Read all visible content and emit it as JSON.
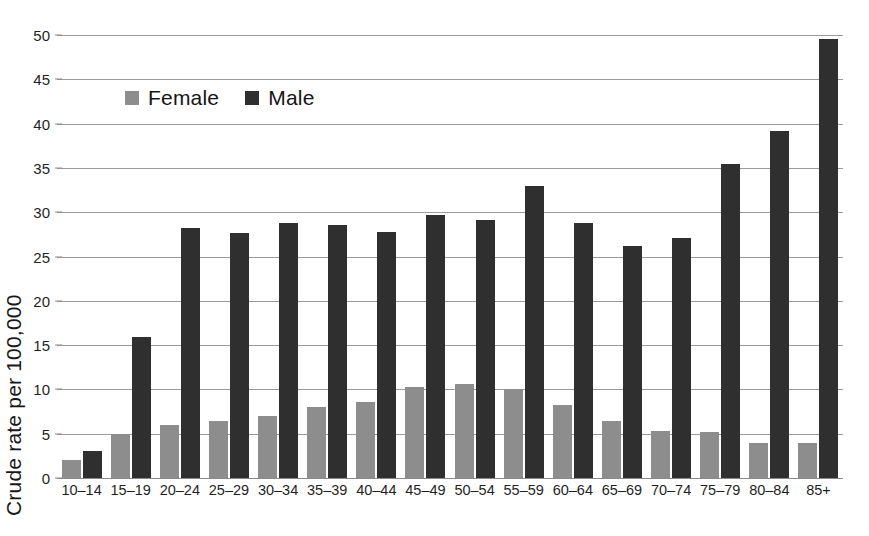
{
  "chart_data": {
    "type": "bar",
    "title": "",
    "xlabel": "",
    "ylabel": "Crude rate per 100,000",
    "ylim": [
      0,
      50
    ],
    "yticks": [
      0,
      5,
      10,
      15,
      20,
      25,
      30,
      35,
      40,
      45,
      50
    ],
    "grid": true,
    "legend_position": "upper-left-inside",
    "categories": [
      "10–14",
      "15–19",
      "20–24",
      "25–29",
      "30–34",
      "35–39",
      "40–44",
      "45–49",
      "50–54",
      "55–59",
      "60–64",
      "65–69",
      "70–74",
      "75–79",
      "80–84",
      "85+"
    ],
    "series": [
      {
        "name": "Female",
        "color": "#8d8d8d",
        "values": [
          2.0,
          5.0,
          6.0,
          6.4,
          7.0,
          8.0,
          8.6,
          10.3,
          10.6,
          10.0,
          8.2,
          6.4,
          5.3,
          5.2,
          3.9,
          3.9
        ]
      },
      {
        "name": "Male",
        "color": "#2f2f2f",
        "values": [
          3.0,
          15.9,
          28.2,
          27.6,
          28.8,
          28.6,
          27.8,
          29.7,
          29.1,
          33.0,
          28.8,
          26.2,
          27.1,
          35.4,
          39.2,
          49.5
        ]
      }
    ]
  },
  "legend": {
    "items": [
      {
        "label": "Female",
        "swatch": "female-swatch"
      },
      {
        "label": "Male",
        "swatch": "male-swatch"
      }
    ]
  },
  "colors": {
    "female": "#8d8d8d",
    "male": "#2f2f2f",
    "gridline": "#9b9b9b",
    "axis": "#8a8a8a",
    "background": "#ffffff",
    "text": "#1f1f1f"
  }
}
